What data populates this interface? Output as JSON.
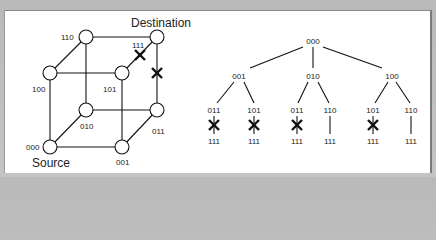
{
  "hypercube": {
    "title_source": "Source",
    "title_destination": "Destination",
    "nodes": [
      {
        "id": "000",
        "label": "000"
      },
      {
        "id": "001",
        "label": "001"
      },
      {
        "id": "010",
        "label": "010"
      },
      {
        "id": "011",
        "label": "011"
      },
      {
        "id": "100",
        "label": "100"
      },
      {
        "id": "101",
        "label": "101"
      },
      {
        "id": "110",
        "label": "110"
      },
      {
        "id": "111",
        "label": "111"
      }
    ],
    "edges": [
      [
        "000",
        "001"
      ],
      [
        "000",
        "010"
      ],
      [
        "000",
        "100"
      ],
      [
        "001",
        "011"
      ],
      [
        "001",
        "101"
      ],
      [
        "010",
        "011"
      ],
      [
        "010",
        "110"
      ],
      [
        "100",
        "101"
      ],
      [
        "100",
        "110"
      ],
      [
        "011",
        "111"
      ],
      [
        "101",
        "111"
      ],
      [
        "110",
        "111"
      ]
    ],
    "failed_edges": [
      [
        "101",
        "111"
      ],
      [
        "011",
        "111"
      ]
    ]
  },
  "tree": {
    "root": "000",
    "level1": [
      "001",
      "010",
      "100"
    ],
    "level2": [
      {
        "parent": "001",
        "label": "011",
        "leaf": "111",
        "blocked": true
      },
      {
        "parent": "001",
        "label": "101",
        "leaf": "111",
        "blocked": true
      },
      {
        "parent": "010",
        "label": "011",
        "leaf": "111",
        "blocked": true
      },
      {
        "parent": "010",
        "label": "110",
        "leaf": "111",
        "blocked": false
      },
      {
        "parent": "100",
        "label": "101",
        "leaf": "111",
        "blocked": true
      },
      {
        "parent": "100",
        "label": "110",
        "leaf": "111",
        "blocked": false
      }
    ]
  },
  "colors": {
    "background": "#c0c0c0",
    "panel": "#ffffff",
    "ink": "#111111"
  }
}
